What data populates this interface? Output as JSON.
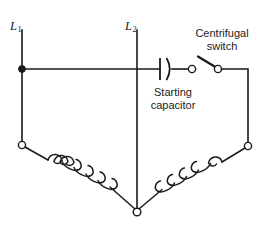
{
  "diagram": {
    "background_color": "#ffffff",
    "line_color": "#1a1a1a",
    "labels": {
      "line_1": "L",
      "line_1_sub": "1",
      "line_2": "L",
      "line_2_sub": "2",
      "centrifugal_switch": "Centrifugal\nswitch",
      "centrifugal_switch_line1": "Centrifugal",
      "centrifugal_switch_line2": "switch",
      "starting_capacitor": "Starting\ncapacitor",
      "starting_capacitor_line1": "Starting",
      "starting_capacitor_line2": "capacitor"
    },
    "components": [
      {
        "name": "line-1-conductor",
        "type": "vertical-wire",
        "label": "L1",
        "x": 22,
        "y_top": 30,
        "y_bottom": 145
      },
      {
        "name": "line-2-conductor",
        "type": "vertical-wire",
        "label": "L2",
        "x": 137,
        "y_top": 30,
        "y_bottom": 212
      },
      {
        "name": "supply-junction-dot",
        "type": "solid-junction",
        "x": 22,
        "y": 69
      },
      {
        "name": "horizontal-supply-wire",
        "type": "horizontal-wire",
        "y": 69,
        "x_start": 22,
        "x_end": 160
      },
      {
        "name": "starting-capacitor",
        "type": "capacitor",
        "style": "one-flat-one-curved-plate",
        "x_flat_plate": 160,
        "x_curved_plate": 169,
        "y_center": 69,
        "plate_height": 22
      },
      {
        "name": "centrifugal-switch",
        "type": "spst-switch",
        "state": "open",
        "left_contact_x": 192,
        "right_contact_x": 218,
        "y": 69,
        "blade_tip_x": 199,
        "blade_tip_y": 57
      },
      {
        "name": "right-return-wire",
        "type": "wire-path",
        "points": "218,69 248,69 248,146"
      },
      {
        "name": "left-winding-terminal",
        "type": "open-terminal",
        "x": 22,
        "y": 145
      },
      {
        "name": "right-winding-terminal",
        "type": "open-terminal",
        "x": 248,
        "y": 146
      },
      {
        "name": "center-common-terminal",
        "type": "open-terminal",
        "x": 137,
        "y": 212
      },
      {
        "name": "left-winding-coil",
        "type": "inductor-coil",
        "loops": 5,
        "start_x": 22,
        "start_y": 145,
        "end_x": 137,
        "end_y": 212
      },
      {
        "name": "right-winding-coil",
        "type": "inductor-coil",
        "loops": 5,
        "start_x": 248,
        "start_y": 146,
        "end_x": 137,
        "end_y": 212
      }
    ]
  }
}
